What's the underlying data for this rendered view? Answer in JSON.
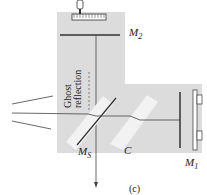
{
  "figure": {
    "caption": "(c)",
    "colors": {
      "background": "#ffffff",
      "housing": "#dcdcdc",
      "plate": "#f2f2f2",
      "line": "#333333"
    },
    "labels": {
      "mirror_top": "M",
      "mirror_top_sub": "2",
      "mirror_right": "M",
      "mirror_right_sub": "1",
      "splitter": "M",
      "splitter_sub": "S",
      "compensator": "C",
      "ghost_line1": "Ghost",
      "ghost_line2": "reflection"
    }
  }
}
